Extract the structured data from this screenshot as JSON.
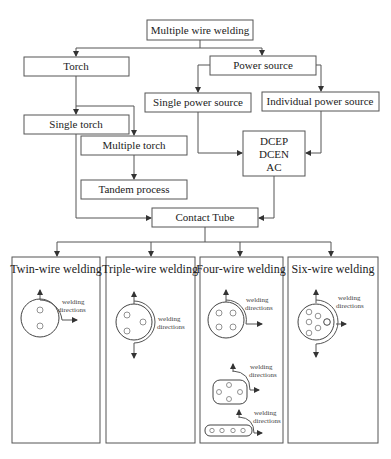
{
  "diagram": {
    "root": {
      "label": "Multiple wire welding"
    },
    "torch": {
      "label": "Torch"
    },
    "power_source": {
      "label": "Power source"
    },
    "single_power_source": {
      "label": "Single power source"
    },
    "individual_power_source": {
      "label": "Individual power source"
    },
    "single_torch": {
      "label": "Single torch"
    },
    "multiple_torch": {
      "label": "Multiple torch"
    },
    "tandem_process": {
      "label": "Tandem process"
    },
    "current_types": {
      "lines": [
        "DCEP",
        "DCEN",
        "AC"
      ]
    },
    "contact_tube": {
      "label": "Contact Tube"
    },
    "panels": [
      {
        "title": "Twin-wire welding",
        "annotation": [
          "welding",
          "directions"
        ]
      },
      {
        "title": "Triple-wire welding",
        "annotation": [
          "welding",
          "directions"
        ]
      },
      {
        "title": "Four-wire welding",
        "annotation": [
          "welding",
          "directions"
        ],
        "extra_annotations": [
          [
            "welding",
            "directions"
          ],
          [
            "welding",
            "directions"
          ]
        ]
      },
      {
        "title": "Six-wire welding",
        "annotation": [
          "welding",
          "directions"
        ]
      }
    ]
  }
}
